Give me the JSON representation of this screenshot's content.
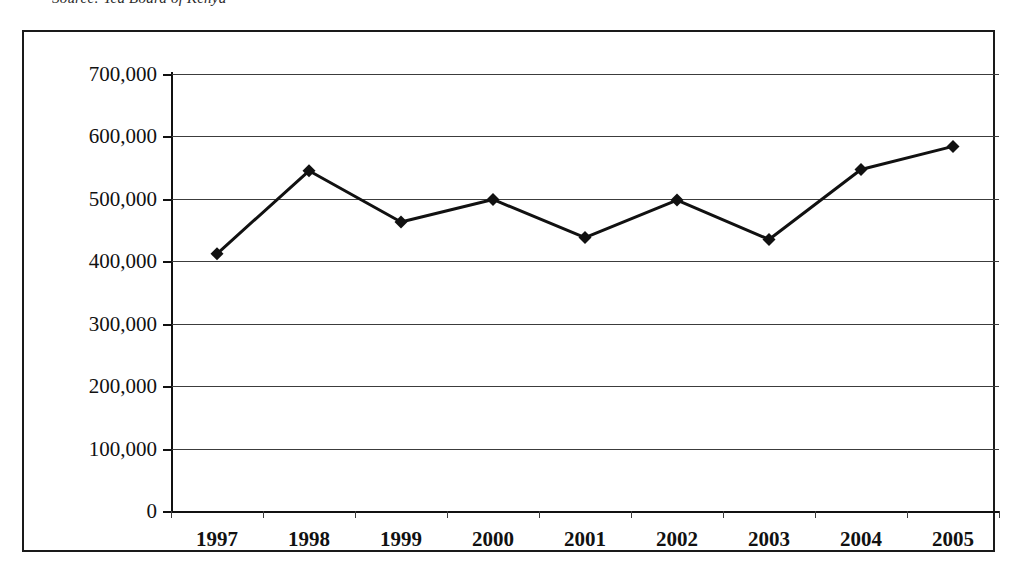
{
  "caption": {
    "text": "Source: Tea Board of Kenya"
  },
  "chart_data": {
    "type": "line",
    "title": "",
    "subtitle": "",
    "xlabel": "",
    "ylabel": "",
    "categories": [
      "1997",
      "1998",
      "1999",
      "2000",
      "2001",
      "2002",
      "2003",
      "2004",
      "2005"
    ],
    "values": [
      412000,
      545000,
      463000,
      499000,
      438000,
      498000,
      435000,
      547000,
      584000
    ],
    "series": [
      {
        "name": "Production",
        "values": [
          412000,
          545000,
          463000,
          499000,
          438000,
          498000,
          435000,
          547000,
          584000
        ]
      }
    ],
    "ylim": [
      0,
      700000
    ],
    "ytick_labels": [
      "700,000",
      "600,000",
      "500,000",
      "400,000",
      "300,000",
      "200,000",
      "100,000",
      "0"
    ],
    "ytick_values": [
      700000,
      600000,
      500000,
      400000,
      300000,
      200000,
      100000,
      0
    ],
    "grid": true,
    "legend": false,
    "legend_position": "none",
    "marker": "diamond",
    "line_color": "#111111",
    "marker_color": "#111111",
    "grid_color": "#3c3c3c",
    "background_color": "#ffffff",
    "border_color": "#1a1a1a"
  }
}
